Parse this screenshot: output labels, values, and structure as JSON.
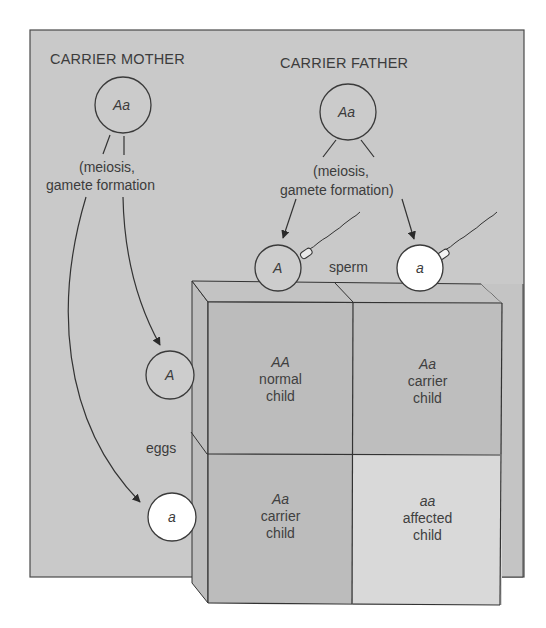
{
  "colors": {
    "panel": "#c9c9c9",
    "panel_border": "#4a4a4a",
    "box_side": "#bdbdbd",
    "box_top": "#c3c3c3",
    "cell_dark": "#bcbcbc",
    "cell_light": "#d9d9d9",
    "gamete_A": "#cdcdcd",
    "gamete_a": "#ffffff",
    "line": "#333333"
  },
  "mother": {
    "title": "CARRIER MOTHER",
    "genotype": "Aa",
    "process_line1": "(meiosis,",
    "process_line2": "gamete formation"
  },
  "father": {
    "title": "CARRIER FATHER",
    "genotype": "Aa",
    "process_line1": "(meiosis,",
    "process_line2": "gamete formation)"
  },
  "gametes": {
    "sperm_label": "sperm",
    "eggs_label": "eggs",
    "sperm": [
      {
        "allele": "A",
        "style": "dominant"
      },
      {
        "allele": "a",
        "style": "recessive"
      }
    ],
    "eggs": [
      {
        "allele": "A",
        "style": "dominant"
      },
      {
        "allele": "a",
        "style": "recessive"
      }
    ]
  },
  "punnett": {
    "cells": [
      {
        "genotype": "AA",
        "line1": "normal",
        "line2": "child",
        "shade": "dark"
      },
      {
        "genotype": "Aa",
        "line1": "carrier",
        "line2": "child",
        "shade": "dark"
      },
      {
        "genotype": "Aa",
        "line1": "carrier",
        "line2": "child",
        "shade": "dark"
      },
      {
        "genotype": "aa",
        "line1": "affected",
        "line2": "child",
        "shade": "light"
      }
    ]
  }
}
